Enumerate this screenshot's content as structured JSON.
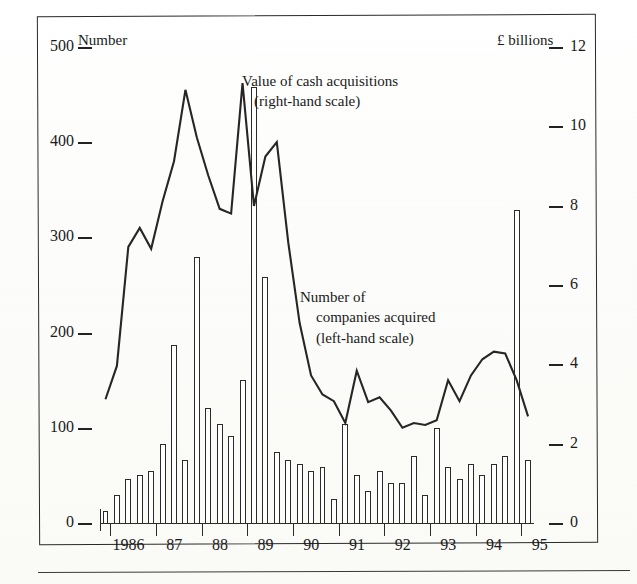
{
  "figure": {
    "left_axis_caption": "Number",
    "right_axis_caption": "£ billions",
    "annotation_value": {
      "line1": "Value of cash acquisitions",
      "line2": "(right-hand scale)"
    },
    "annotation_number": {
      "line1": "Number of",
      "line2": "companies acquired",
      "line3": "(left-hand scale)"
    }
  },
  "chart_data": {
    "type": "bar",
    "title": "",
    "subtitle": "",
    "xlabel": "",
    "ylabel": "Number",
    "y2label": "£ billions",
    "grid": false,
    "legend_position": "inline-annotations",
    "ylim": [
      0,
      500
    ],
    "y2lim": [
      0,
      12
    ],
    "yticks": [
      0,
      100,
      200,
      300,
      400,
      500
    ],
    "y2ticks": [
      0,
      2,
      4,
      6,
      8,
      10,
      12
    ],
    "xticks": [
      "1986",
      "87",
      "88",
      "89",
      "90",
      "91",
      "92",
      "93",
      "94",
      "95"
    ],
    "x_tick_years": [
      1986,
      1987,
      1988,
      1989,
      1990,
      1991,
      1992,
      1993,
      1994,
      1995
    ],
    "x_period_labels": [
      "1985Q4",
      "1986Q1",
      "1986Q2",
      "1986Q3",
      "1986Q4",
      "1987Q1",
      "1987Q2",
      "1987Q3",
      "1987Q4",
      "1988Q1",
      "1988Q2",
      "1988Q3",
      "1988Q4",
      "1989Q1",
      "1989Q2",
      "1989Q3",
      "1989Q4",
      "1990Q1",
      "1990Q2",
      "1990Q3",
      "1990Q4",
      "1991Q1",
      "1991Q2",
      "1991Q3",
      "1991Q4",
      "1992Q1",
      "1992Q2",
      "1992Q3",
      "1992Q4",
      "1993Q1",
      "1993Q2",
      "1993Q3",
      "1993Q4",
      "1994Q1",
      "1994Q2",
      "1994Q3",
      "1994Q4",
      "1995Q1",
      "1995Q2"
    ],
    "series": [
      {
        "name": "Value of cash acquisitions",
        "render": "bar",
        "axis": "right",
        "unit": "£ billions",
        "values": [
          0.3,
          0.7,
          1.1,
          1.2,
          1.3,
          2.0,
          4.5,
          1.6,
          6.7,
          2.9,
          2.5,
          2.2,
          3.6,
          11.0,
          6.2,
          1.8,
          1.6,
          1.5,
          1.3,
          1.4,
          0.6,
          2.5,
          1.2,
          0.8,
          1.3,
          1.0,
          1.0,
          1.7,
          0.7,
          2.4,
          1.4,
          1.1,
          1.5,
          1.2,
          1.5,
          1.7,
          7.9,
          1.6
        ]
      },
      {
        "name": "Number of companies acquired",
        "render": "line",
        "axis": "left",
        "unit": "Number",
        "values": [
          130,
          165,
          290,
          310,
          288,
          338,
          380,
          455,
          405,
          365,
          330,
          325,
          462,
          333,
          385,
          400,
          295,
          210,
          155,
          135,
          128,
          105,
          160,
          127,
          132,
          118,
          100,
          105,
          103,
          108,
          150,
          128,
          155,
          172,
          180,
          178,
          150,
          112
        ]
      }
    ]
  }
}
